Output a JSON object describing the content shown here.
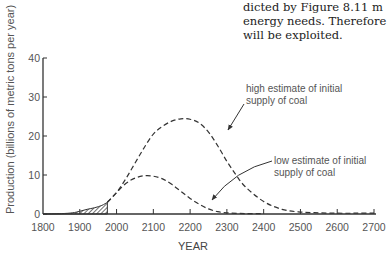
{
  "page_text": {
    "lines": [
      "dicted by Figure 8.11 m",
      "energy needs. Therefore",
      "will be exploited."
    ]
  },
  "chart_data": {
    "type": "line",
    "title": "",
    "xlabel": "YEAR",
    "ylabel": "Production (billions of metric tons per year)",
    "xlim": [
      1800,
      2700
    ],
    "ylim": [
      0,
      40
    ],
    "x_ticks": [
      "1800",
      "1900",
      "2000",
      "2100",
      "2200",
      "2300",
      "2400",
      "2500",
      "2600",
      "2700"
    ],
    "y_ticks": [
      "0",
      "10",
      "20",
      "30",
      "40"
    ],
    "grid": false,
    "legend": "annotations",
    "historical": {
      "name": "historical production (hatched)",
      "x": [
        1800,
        1850,
        1880,
        1900,
        1920,
        1940,
        1960,
        1975
      ],
      "y": [
        0,
        0.1,
        0.3,
        0.7,
        1.2,
        1.6,
        2.2,
        3.0
      ]
    },
    "series": [
      {
        "name": "high estimate of initial supply of coal",
        "style": "dashed",
        "x": [
          1975,
          2000,
          2025,
          2050,
          2075,
          2100,
          2125,
          2150,
          2175,
          2200,
          2225,
          2250,
          2275,
          2300,
          2325,
          2350,
          2400,
          2450,
          2500,
          2550,
          2600,
          2650,
          2700
        ],
        "y": [
          3.0,
          5.5,
          9.0,
          13.0,
          17.0,
          20.5,
          22.5,
          23.8,
          24.4,
          24.3,
          23.3,
          21.0,
          17.5,
          13.5,
          10.0,
          7.0,
          3.2,
          1.2,
          0.5,
          0.3,
          0.2,
          0.2,
          0.2
        ]
      },
      {
        "name": "low estimate of initial supply of coal",
        "style": "dashed",
        "x": [
          1975,
          2000,
          2025,
          2050,
          2075,
          2100,
          2125,
          2150,
          2175,
          2200,
          2225,
          2250,
          2275,
          2300,
          2350,
          2400
        ],
        "y": [
          3.0,
          5.5,
          7.8,
          9.2,
          9.8,
          9.7,
          9.0,
          7.6,
          5.8,
          4.0,
          2.5,
          1.3,
          0.6,
          0.3,
          0.1,
          0.1
        ]
      }
    ],
    "annotations": [
      {
        "text_lines": [
          "high estimate of initial",
          "supply of coal"
        ],
        "points_to_year": 2245
      },
      {
        "text_lines": [
          "low estimate of initial",
          "supply of coal"
        ],
        "points_to_year": 2220
      }
    ]
  }
}
